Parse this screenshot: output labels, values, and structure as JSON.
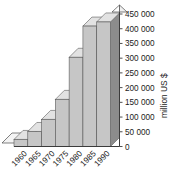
{
  "chart_data": {
    "type": "bar",
    "title": "",
    "xlabel": "",
    "ylabel": "million US $",
    "categories": [
      "1960",
      "1965",
      "1970",
      "1975",
      "1980",
      "1985",
      "1990"
    ],
    "values": [
      24000,
      51000,
      92000,
      160000,
      303000,
      409000,
      423000
    ],
    "ylim": [
      0,
      450000
    ],
    "yticks": [
      0,
      50000,
      100000,
      150000,
      200000,
      250000,
      300000,
      350000,
      400000,
      450000
    ],
    "ytick_labels": [
      "0",
      "50 000",
      "100 000",
      "150 000",
      "200 000",
      "250 000",
      "300 000",
      "350 000",
      "400 000",
      "450 000"
    ],
    "grid": false,
    "legend": "none",
    "style": "3d-bar",
    "colors": {
      "bar_front": "#c6c6c6",
      "bar_top": "#e2e2e2",
      "bar_side": "#8c8c8c",
      "axis": "#3b3b3b",
      "background": "#ffffff",
      "text": "#1a1a1a"
    }
  },
  "axis": {
    "y_title": "million US $"
  }
}
